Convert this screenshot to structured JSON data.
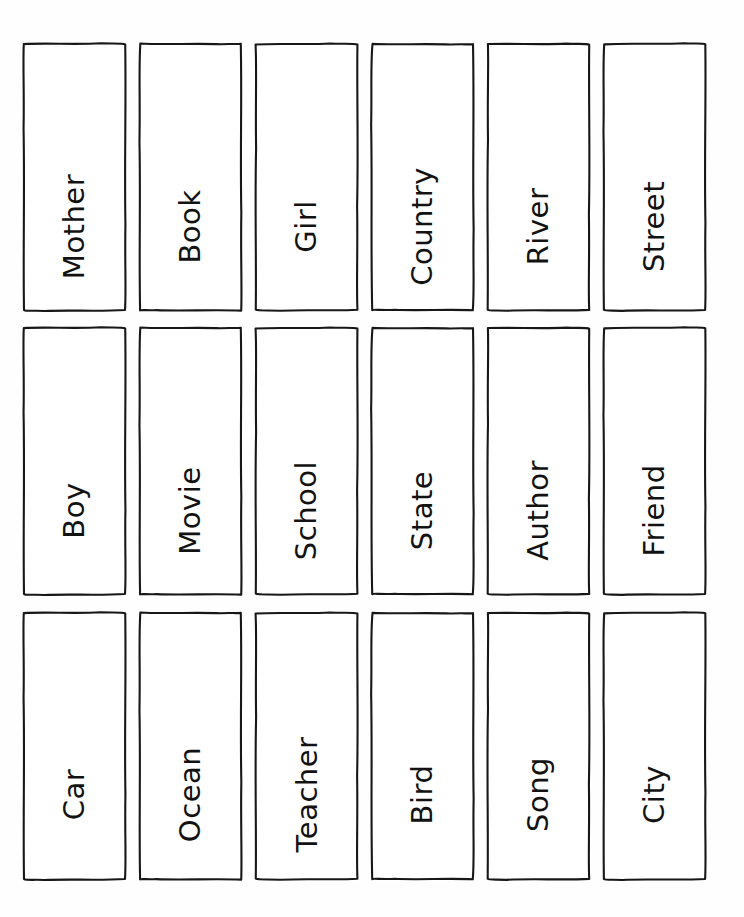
{
  "worksheet": {
    "title": "Noun Flashcards",
    "page_background": "#fefefe",
    "ink_color": "#171717",
    "columns": 6,
    "rows": 3,
    "card_count": 18
  },
  "cards": [
    {
      "label": "Mother",
      "row": 1,
      "column": 1
    },
    {
      "label": "Book",
      "row": 1,
      "column": 2
    },
    {
      "label": "Girl",
      "row": 1,
      "column": 3
    },
    {
      "label": "Country",
      "row": 1,
      "column": 4
    },
    {
      "label": "River",
      "row": 1,
      "column": 5
    },
    {
      "label": "Street",
      "row": 1,
      "column": 6
    },
    {
      "label": "Boy",
      "row": 2,
      "column": 1
    },
    {
      "label": "Movie",
      "row": 2,
      "column": 2
    },
    {
      "label": "School",
      "row": 2,
      "column": 3
    },
    {
      "label": "State",
      "row": 2,
      "column": 4
    },
    {
      "label": "Author",
      "row": 2,
      "column": 5
    },
    {
      "label": "Friend",
      "row": 2,
      "column": 6
    },
    {
      "label": "Car",
      "row": 3,
      "column": 1
    },
    {
      "label": "Ocean",
      "row": 3,
      "column": 2
    },
    {
      "label": "Teacher",
      "row": 3,
      "column": 3
    },
    {
      "label": "Bird",
      "row": 3,
      "column": 4
    },
    {
      "label": "Song",
      "row": 3,
      "column": 5
    },
    {
      "label": "City",
      "row": 3,
      "column": 6
    }
  ]
}
